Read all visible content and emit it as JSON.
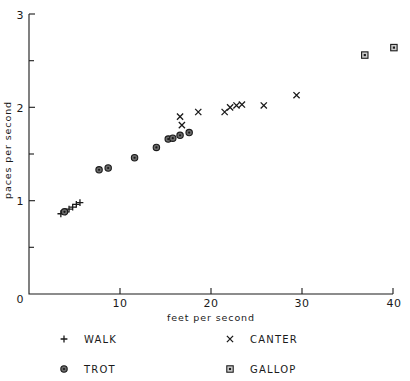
{
  "chart_data": {
    "type": "scatter",
    "title": "",
    "xlabel": "feet per second",
    "ylabel": "paces per second",
    "xlim": [
      0,
      40
    ],
    "ylim": [
      0,
      3
    ],
    "xticks": [
      0,
      10,
      20,
      30,
      40
    ],
    "xtick_labels": [
      "0",
      "10",
      "20",
      "30",
      "40"
    ],
    "yticks": [
      0,
      1,
      2,
      3
    ],
    "ytick_labels": [
      "0",
      "1",
      "2",
      "3"
    ],
    "yminor_ticks": [
      0.5,
      1.5,
      2.5
    ],
    "grid": false,
    "legend_position": "below-axes",
    "series": [
      {
        "name": "WALK",
        "marker": "plus",
        "points": [
          [
            3.5,
            0.86
          ],
          [
            4.0,
            0.88
          ],
          [
            4.4,
            0.91
          ],
          [
            4.8,
            0.93
          ],
          [
            5.2,
            0.96
          ],
          [
            5.6,
            0.98
          ]
        ]
      },
      {
        "name": "TROT",
        "marker": "circle",
        "points": [
          [
            3.9,
            0.88
          ],
          [
            7.7,
            1.33
          ],
          [
            8.7,
            1.35
          ],
          [
            11.6,
            1.46
          ],
          [
            14.0,
            1.57
          ],
          [
            15.3,
            1.66
          ],
          [
            15.8,
            1.67
          ],
          [
            16.6,
            1.7
          ],
          [
            17.6,
            1.73
          ]
        ]
      },
      {
        "name": "CANTER",
        "marker": "cross",
        "points": [
          [
            16.6,
            1.9
          ],
          [
            16.8,
            1.81
          ],
          [
            18.6,
            1.95
          ],
          [
            21.5,
            1.95
          ],
          [
            22.1,
            2.0
          ],
          [
            22.8,
            2.02
          ],
          [
            23.4,
            2.03
          ],
          [
            25.8,
            2.02
          ],
          [
            29.4,
            2.13
          ]
        ]
      },
      {
        "name": "GALLOP",
        "marker": "square",
        "points": [
          [
            36.9,
            2.56
          ],
          [
            40.1,
            2.64
          ]
        ]
      }
    ]
  },
  "legend": {
    "entries": [
      {
        "label": "WALK",
        "marker": "plus"
      },
      {
        "label": "CANTER",
        "marker": "cross"
      },
      {
        "label": "TROT",
        "marker": "circle"
      },
      {
        "label": "GALLOP",
        "marker": "square"
      }
    ]
  },
  "colors": {
    "axis": "#1a1a1a",
    "text": "#1a1a1a",
    "marker_stroke": "#1a1a1a",
    "circle_fill": "#6b6b6b",
    "square_fill": "#cfcfcf",
    "background": "#ffffff"
  }
}
